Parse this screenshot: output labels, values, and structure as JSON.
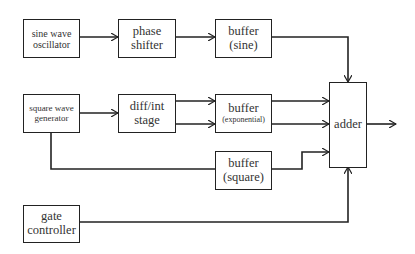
{
  "diagram": {
    "type": "signal-flow block diagram",
    "blocks": [
      {
        "id": "sine_osc",
        "lines": [
          "sine wave",
          "oscillator"
        ]
      },
      {
        "id": "phase_shifter",
        "lines": [
          "phase",
          "shifter"
        ]
      },
      {
        "id": "buffer_sine",
        "lines": [
          "buffer",
          "(sine)"
        ]
      },
      {
        "id": "square_gen",
        "lines": [
          "square wave",
          "generator"
        ]
      },
      {
        "id": "diff_int",
        "lines": [
          "diff/int",
          "stage"
        ]
      },
      {
        "id": "buffer_exp",
        "lines": [
          "buffer",
          "(exponential)"
        ]
      },
      {
        "id": "buffer_square",
        "lines": [
          "buffer",
          "(square)"
        ]
      },
      {
        "id": "gate_ctrl",
        "lines": [
          "gate",
          "controller"
        ]
      },
      {
        "id": "adder",
        "lines": [
          "adder"
        ]
      }
    ],
    "connections": [
      {
        "from": "sine_osc",
        "to": "phase_shifter"
      },
      {
        "from": "phase_shifter",
        "to": "buffer_sine"
      },
      {
        "from": "buffer_sine",
        "to": "adder",
        "port": "top"
      },
      {
        "from": "square_gen",
        "to": "diff_int"
      },
      {
        "from": "diff_int",
        "to": "buffer_exp",
        "count": 2
      },
      {
        "from": "buffer_exp",
        "to": "adder",
        "count": 2
      },
      {
        "from": "square_gen",
        "to": "buffer_square"
      },
      {
        "from": "buffer_square",
        "to": "adder"
      },
      {
        "from": "gate_ctrl",
        "to": "adder",
        "port": "bottom"
      },
      {
        "from": "adder",
        "to": "output"
      }
    ],
    "colors": {
      "line": "#222222",
      "text": "#333333",
      "background": "#ffffff"
    }
  }
}
